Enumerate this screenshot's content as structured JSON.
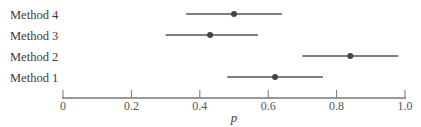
{
  "chart_data": {
    "type": "scatter",
    "subtype": "interval-dot-plot",
    "title": "",
    "xlabel": "p",
    "ylabel": "",
    "xlim": [
      0,
      1.0
    ],
    "xticks": [
      0,
      0.2,
      0.4,
      0.6,
      0.8,
      1.0
    ],
    "xtick_labels": [
      "0",
      "0.2",
      "0.4",
      "0.6",
      "0.8",
      "1.0"
    ],
    "grid": false,
    "legend": null,
    "categories": [
      "Method 4",
      "Method 3",
      "Method 2",
      "Method 1"
    ],
    "series": [
      {
        "name": "Method 4",
        "estimate": 0.5,
        "lower": 0.36,
        "upper": 0.64
      },
      {
        "name": "Method 3",
        "estimate": 0.43,
        "lower": 0.3,
        "upper": 0.57
      },
      {
        "name": "Method 2",
        "estimate": 0.84,
        "lower": 0.7,
        "upper": 0.98
      },
      {
        "name": "Method 1",
        "estimate": 0.62,
        "lower": 0.48,
        "upper": 0.76
      }
    ],
    "colors": {
      "line": "#555555",
      "dot": "#444444",
      "axis": "#666666"
    }
  }
}
